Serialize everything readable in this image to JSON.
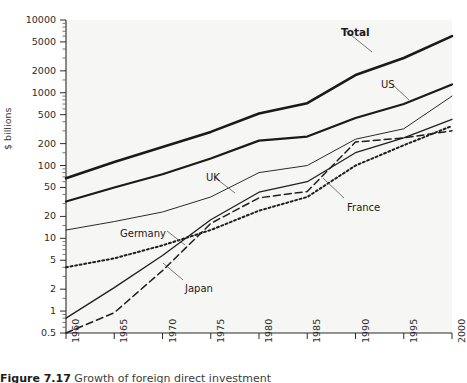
{
  "figure": {
    "caption_number": "Figure 7.17",
    "caption_text": "Growth of foreign direct investment",
    "ylabel": "$ billions"
  },
  "chart_data": {
    "type": "line",
    "title": "",
    "xlabel": "",
    "ylabel": "$ billions",
    "yscale": "log",
    "ylim": [
      0.5,
      10000
    ],
    "xlim": [
      1960,
      2000
    ],
    "grid": false,
    "legend": "inline-labels",
    "yticks": [
      0.5,
      1,
      2,
      5,
      10,
      20,
      50,
      100,
      200,
      500,
      1000,
      2000,
      5000,
      10000
    ],
    "ytick_labels": [
      "0.5",
      "1",
      "2",
      "5",
      "10",
      "20",
      "50",
      "100",
      "200",
      "500",
      "1000",
      "2000",
      "5000",
      "10000"
    ],
    "xticks": [
      1960,
      1965,
      1970,
      1975,
      1980,
      1985,
      1990,
      1995,
      2000
    ],
    "xtick_labels": [
      "1960",
      "1965",
      "1970",
      "1975",
      "1980",
      "1985",
      "1990",
      "1995",
      "2000"
    ],
    "x": [
      1960,
      1965,
      1970,
      1975,
      1980,
      1985,
      1990,
      1995,
      2000
    ],
    "series": [
      {
        "name": "Total",
        "label": "Total",
        "style": "solid-heavy",
        "color": "#1a1a1a",
        "width": 2.6,
        "values": [
          67,
          112,
          180,
          290,
          520,
          720,
          1750,
          3000,
          6000
        ]
      },
      {
        "name": "US",
        "label": "US",
        "style": "solid-heavy",
        "color": "#1a1a1a",
        "width": 2.2,
        "values": [
          32,
          50,
          76,
          125,
          220,
          250,
          450,
          700,
          1300
        ]
      },
      {
        "name": "UK",
        "label": "UK",
        "style": "solid-thin",
        "color": "#2b2b2b",
        "width": 1.0,
        "values": [
          13,
          17,
          23,
          37,
          80,
          100,
          230,
          320,
          900
        ]
      },
      {
        "name": "Germany",
        "label": "Germany",
        "style": "solid-thin",
        "color": "#1f1f1f",
        "width": 1.3,
        "values": [
          0.8,
          2.1,
          5.8,
          18,
          43,
          60,
          150,
          240,
          430
        ]
      },
      {
        "name": "Japan",
        "label": "Japan",
        "style": "dashed",
        "color": "#1f1f1f",
        "width": 1.5,
        "values": [
          0.5,
          0.95,
          3.6,
          16,
          36,
          44,
          210,
          240,
          300
        ]
      },
      {
        "name": "France",
        "label": "France",
        "style": "dotted",
        "color": "#1f1f1f",
        "width": 2.0,
        "values": [
          4,
          5.3,
          8.0,
          13,
          24,
          37,
          100,
          190,
          350
        ]
      }
    ],
    "annotations": [
      {
        "text": "Total",
        "x_px": 341,
        "y_px": 26,
        "bold": true
      },
      {
        "text": "US",
        "x_px": 381,
        "y_px": 79,
        "bold": false
      },
      {
        "text": "UK",
        "x_px": 206,
        "y_px": 172,
        "bold": false
      },
      {
        "text": "Germany",
        "x_px": 120,
        "y_px": 228,
        "bold": false
      },
      {
        "text": "Japan",
        "x_px": 185,
        "y_px": 283,
        "bold": false
      },
      {
        "text": "France",
        "x_px": 347,
        "y_px": 202,
        "bold": false
      }
    ]
  }
}
